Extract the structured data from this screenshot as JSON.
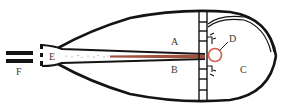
{
  "diagram": {
    "labels": {
      "A": "A",
      "B": "B",
      "C": "C",
      "D": "D",
      "E": "E",
      "F": "F"
    },
    "colors": {
      "outline": "#141414",
      "tube": "#a0503c",
      "tube_fill": "#c98a78",
      "circle": "#d06050",
      "label": "#3a3a3a",
      "background": "#ffffff"
    }
  }
}
